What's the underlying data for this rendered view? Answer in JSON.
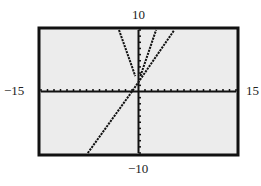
{
  "chart_data": {
    "type": "line",
    "title": "",
    "xlabel": "",
    "ylabel": "",
    "xlim": [
      -15,
      15
    ],
    "ylim": [
      -10,
      10
    ],
    "axis_labels": {
      "xmin": "−15",
      "xmax": "15",
      "ymin": "−10",
      "ymax": "10"
    },
    "grid": false,
    "tick_marks": true,
    "xscl": 1,
    "yscl": 1,
    "series": [
      {
        "name": "V-shaped curve (left branch)",
        "points": [
          [
            -3,
            10
          ],
          [
            -0.5,
            2.5
          ]
        ]
      },
      {
        "name": "V-shaped curve (right branch)",
        "points": [
          [
            0.3,
            2.5
          ],
          [
            2.7,
            10
          ]
        ]
      },
      {
        "name": "line",
        "points": [
          [
            -7.8,
            -10
          ],
          [
            -1,
            0
          ],
          [
            5.5,
            10
          ]
        ]
      }
    ],
    "colors": {
      "background": "#ececec",
      "frame": "#111111",
      "curve": "#111111"
    }
  }
}
